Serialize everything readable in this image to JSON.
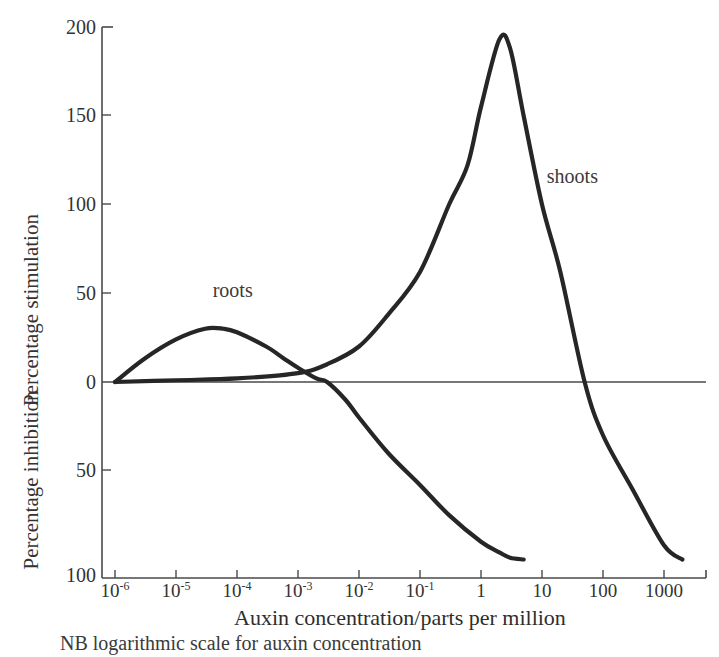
{
  "chart_data": {
    "type": "line",
    "title": "",
    "subtitle": "",
    "xlabel": "Auxin concentration/parts per million",
    "ylabel_upper": "Percentage stimulation",
    "ylabel_lower": "Percentage inhibition",
    "caption": "NB logarithmic scale for auxin concentration",
    "xscale": "log",
    "xlim": [
      1e-06,
      10000
    ],
    "ylim": [
      -100,
      200
    ],
    "grid": false,
    "legend_position": "inline-annotation",
    "x_tick_labels": [
      "10⁻⁶",
      "10⁻⁵",
      "10⁻⁴",
      "10⁻³",
      "10⁻²",
      "10⁻¹",
      "1",
      "10",
      "100",
      "1000"
    ],
    "x_tick_bases": [
      "10",
      "10",
      "10",
      "10",
      "10",
      "10",
      "1",
      "10",
      "100",
      "1000"
    ],
    "x_tick_exponents": [
      "-6",
      "-5",
      "-4",
      "-3",
      "-2",
      "-1",
      "",
      "",
      "",
      ""
    ],
    "x_tick_values": [
      1e-06,
      1e-05,
      0.0001,
      0.001,
      0.01,
      0.1,
      1,
      10,
      100,
      1000
    ],
    "y_tick_labels_upper": [
      "200",
      "150",
      "100",
      "50",
      "0"
    ],
    "y_tick_values_upper": [
      200,
      150,
      100,
      50,
      0
    ],
    "y_tick_labels_lower": [
      "50",
      "100"
    ],
    "y_tick_values_lower": [
      -50,
      -100
    ],
    "series": [
      {
        "name": "roots",
        "label": "roots",
        "color": "#262626",
        "annotation_x": 4e-05,
        "annotation_y": 48,
        "peak_x": 4e-05,
        "peak_y": 30,
        "zero_crossing_x": 0.003,
        "x": [
          1e-06,
          3e-06,
          1e-05,
          3e-05,
          6e-05,
          0.0001,
          0.0003,
          0.0006,
          0.001,
          0.002,
          0.003,
          0.006,
          0.01,
          0.03,
          0.1,
          0.3,
          1,
          2,
          3,
          5
        ],
        "y": [
          0,
          13,
          24,
          30,
          30,
          28,
          20,
          13,
          8,
          2,
          0,
          -10,
          -20,
          -40,
          -58,
          -75,
          -90,
          -96,
          -99,
          -100
        ]
      },
      {
        "name": "shoots",
        "label": "shoots",
        "color": "#262626",
        "annotation_x": 12,
        "annotation_y": 112,
        "peak_x": 2.0,
        "peak_y": 193,
        "zero_crossing_x": 50,
        "x": [
          1e-06,
          1e-05,
          0.0001,
          0.001,
          0.003,
          0.01,
          0.03,
          0.1,
          0.3,
          0.6,
          1,
          2,
          3,
          5,
          10,
          20,
          50,
          100,
          300,
          1000,
          2000
        ],
        "y": [
          0,
          1,
          2,
          5,
          10,
          20,
          38,
          62,
          100,
          122,
          155,
          193,
          188,
          150,
          100,
          62,
          0,
          -30,
          -60,
          -92,
          -100
        ]
      }
    ]
  },
  "labels": {
    "roots": "roots",
    "shoots": "shoots",
    "y_upper": "Percentage stimulation",
    "y_lower": "Percentage inhibition",
    "x_axis": "Auxin concentration/parts per million",
    "caption": "NB logarithmic scale for auxin concentration"
  },
  "y_ticks": [
    {
      "label": "200",
      "value": 200
    },
    {
      "label": "150",
      "value": 150
    },
    {
      "label": "100",
      "value": 100
    },
    {
      "label": "50",
      "value": 50
    },
    {
      "label": "0",
      "value": 0
    },
    {
      "label": "50",
      "value": -50
    },
    {
      "label": "100",
      "value": -100
    }
  ],
  "x_ticks": [
    {
      "base": "10",
      "exp": "-6"
    },
    {
      "base": "10",
      "exp": "-5"
    },
    {
      "base": "10",
      "exp": "-4"
    },
    {
      "base": "10",
      "exp": "-3"
    },
    {
      "base": "10",
      "exp": "-2"
    },
    {
      "base": "10",
      "exp": "-1"
    },
    {
      "base": "1",
      "exp": ""
    },
    {
      "base": "10",
      "exp": ""
    },
    {
      "base": "100",
      "exp": ""
    },
    {
      "base": "1000",
      "exp": ""
    }
  ],
  "colors": {
    "background": "#ffffff",
    "curve": "#262626",
    "axis": "#4a4a4a",
    "text": "#333333"
  }
}
